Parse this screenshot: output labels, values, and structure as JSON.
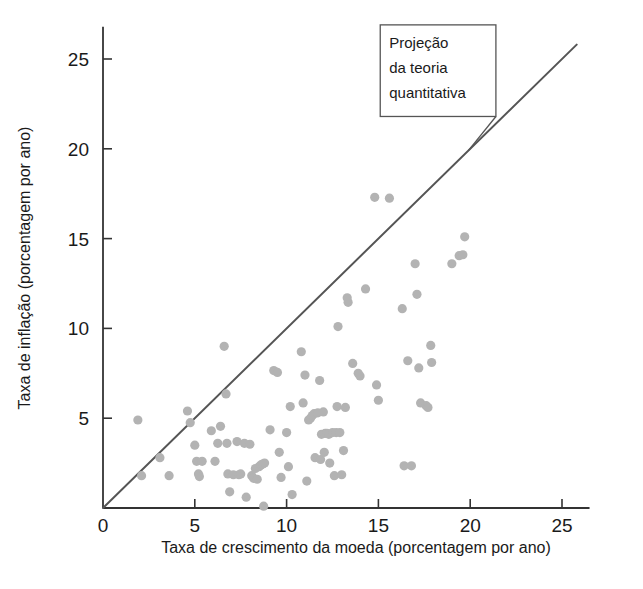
{
  "chart_data": {
    "type": "scatter",
    "title": "",
    "xlabel": "Taxa de crescimento da moeda (porcentagem por ano)",
    "ylabel": "Taxa de inflação (porcentagem por ano)",
    "xlim": [
      0,
      26.5
    ],
    "ylim": [
      0,
      26.8
    ],
    "xticks": [
      0,
      5,
      10,
      15,
      20,
      25
    ],
    "yticks": [
      0,
      5,
      10,
      15,
      20,
      25
    ],
    "xticklabels": [
      "0",
      "5",
      "10",
      "15",
      "20",
      "25"
    ],
    "yticklabels": [
      "",
      "5",
      "10",
      "15",
      "20",
      "25"
    ],
    "grid": false,
    "legend": null,
    "point_color": "#b3b3b3",
    "point_radius": 4.6,
    "line_color": "#555555",
    "axis_color": "#333333",
    "reference_line": {
      "label": "Projeção da teoria quantitativa",
      "slope": 1,
      "intercept": 0,
      "x_start": 0,
      "y_start": 0,
      "x_end": 25.8,
      "y_end": 25.8
    },
    "annotation": {
      "lines": [
        "Projeção",
        "da teoria",
        "quantitativa"
      ],
      "box_x": 15.1,
      "box_y": 26.9,
      "box_w": 6.3,
      "box_h": 5.1,
      "leader_from_x": 21.4,
      "leader_from_y": 21.8,
      "leader_to_x": 19.9,
      "leader_to_y": 19.9
    },
    "points": [
      [
        1.9,
        4.9
      ],
      [
        2.1,
        1.8
      ],
      [
        3.1,
        2.8
      ],
      [
        3.6,
        1.8
      ],
      [
        4.6,
        5.4
      ],
      [
        4.75,
        4.75
      ],
      [
        5.0,
        3.5
      ],
      [
        5.1,
        2.6
      ],
      [
        5.2,
        1.9
      ],
      [
        5.25,
        1.75
      ],
      [
        5.4,
        2.6
      ],
      [
        5.9,
        4.3
      ],
      [
        6.1,
        2.6
      ],
      [
        6.25,
        3.6
      ],
      [
        6.4,
        4.55
      ],
      [
        6.6,
        9.0
      ],
      [
        6.7,
        6.35
      ],
      [
        6.75,
        3.6
      ],
      [
        6.8,
        1.9
      ],
      [
        6.9,
        0.9
      ],
      [
        7.1,
        1.85
      ],
      [
        7.3,
        3.7
      ],
      [
        7.4,
        1.85
      ],
      [
        7.5,
        1.9
      ],
      [
        7.7,
        3.6
      ],
      [
        7.8,
        0.6
      ],
      [
        8.0,
        3.55
      ],
      [
        8.1,
        1.8
      ],
      [
        8.2,
        1.65
      ],
      [
        8.3,
        2.2
      ],
      [
        8.4,
        1.6
      ],
      [
        8.5,
        2.3
      ],
      [
        8.6,
        2.4
      ],
      [
        8.7,
        2.45
      ],
      [
        8.75,
        0.1
      ],
      [
        8.8,
        2.5
      ],
      [
        9.1,
        4.35
      ],
      [
        9.3,
        7.65
      ],
      [
        9.5,
        7.55
      ],
      [
        9.6,
        3.1
      ],
      [
        9.7,
        1.7
      ],
      [
        10.0,
        4.2
      ],
      [
        10.1,
        2.3
      ],
      [
        10.2,
        5.65
      ],
      [
        10.3,
        0.75
      ],
      [
        10.8,
        8.7
      ],
      [
        10.9,
        5.85
      ],
      [
        11.0,
        7.4
      ],
      [
        11.1,
        1.5
      ],
      [
        11.2,
        4.9
      ],
      [
        11.3,
        5.0
      ],
      [
        11.4,
        5.15
      ],
      [
        11.5,
        5.25
      ],
      [
        11.55,
        2.8
      ],
      [
        11.7,
        5.3
      ],
      [
        11.8,
        7.1
      ],
      [
        11.85,
        2.7
      ],
      [
        11.9,
        4.1
      ],
      [
        12.0,
        5.35
      ],
      [
        12.05,
        3.1
      ],
      [
        12.1,
        4.15
      ],
      [
        12.2,
        4.15
      ],
      [
        12.3,
        4.1
      ],
      [
        12.35,
        2.5
      ],
      [
        12.5,
        4.2
      ],
      [
        12.6,
        1.8
      ],
      [
        12.7,
        4.2
      ],
      [
        12.75,
        5.65
      ],
      [
        12.8,
        10.1
      ],
      [
        12.9,
        4.2
      ],
      [
        13.0,
        1.85
      ],
      [
        13.1,
        3.2
      ],
      [
        13.2,
        5.6
      ],
      [
        13.3,
        11.7
      ],
      [
        13.35,
        11.45
      ],
      [
        13.6,
        8.05
      ],
      [
        13.9,
        7.5
      ],
      [
        14.0,
        7.35
      ],
      [
        14.3,
        12.2
      ],
      [
        14.8,
        17.3
      ],
      [
        14.9,
        6.85
      ],
      [
        15.0,
        6.0
      ],
      [
        15.6,
        17.25
      ],
      [
        16.3,
        11.1
      ],
      [
        16.4,
        2.35
      ],
      [
        16.6,
        8.2
      ],
      [
        16.8,
        2.35
      ],
      [
        17.0,
        13.6
      ],
      [
        17.1,
        11.9
      ],
      [
        17.2,
        7.8
      ],
      [
        17.3,
        5.85
      ],
      [
        17.6,
        5.7
      ],
      [
        17.7,
        5.6
      ],
      [
        17.85,
        9.05
      ],
      [
        17.9,
        8.1
      ],
      [
        19.0,
        13.6
      ],
      [
        19.4,
        14.05
      ],
      [
        19.6,
        14.1
      ],
      [
        19.7,
        15.1
      ]
    ]
  }
}
